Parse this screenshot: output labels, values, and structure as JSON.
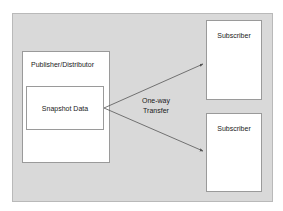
{
  "diagram": {
    "background_color": "#ffffff",
    "container": {
      "fill_color": "#d9d9d9",
      "border_color": "#b9b9b9"
    },
    "node_style": {
      "fill_color": "#ffffff",
      "border_color": "#9a9a9a",
      "text_color": "#1a1a1a"
    },
    "nodes": {
      "publisher": {
        "label": "Publisher/Distributor"
      },
      "snapshot": {
        "label": "Snapshot Data"
      },
      "subscriber_1": {
        "label": "Subscriber"
      },
      "subscriber_2": {
        "label": "Subscriber"
      }
    },
    "edge_label": {
      "line_1": "One-way",
      "line_2": "Transfer"
    },
    "edges": [
      {
        "from": "snapshot",
        "to": "subscriber_1",
        "direction": "one-way",
        "arrowhead": "filled-triangle",
        "color": "#555555"
      },
      {
        "from": "snapshot",
        "to": "subscriber_2",
        "direction": "one-way",
        "arrowhead": "filled-triangle",
        "color": "#555555"
      }
    ]
  }
}
